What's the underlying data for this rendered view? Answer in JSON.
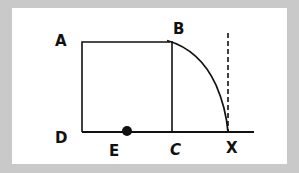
{
  "figure": {
    "colors": {
      "background": "#c9c9c9",
      "panel": "#ffffff",
      "stroke": "#111111"
    },
    "labels": {
      "A": "A",
      "B": "B",
      "C": "C",
      "D": "D",
      "E": "E",
      "X": "X"
    },
    "points": {
      "A": [
        82,
        42
      ],
      "B": [
        172,
        42
      ],
      "C": [
        172,
        132
      ],
      "D": [
        82,
        132
      ],
      "E": [
        127,
        131
      ],
      "X": [
        228,
        132
      ]
    },
    "elements": [
      {
        "type": "square",
        "vertices": [
          "A",
          "B",
          "C",
          "D"
        ]
      },
      {
        "type": "arc",
        "from": "B",
        "to": "X",
        "style": "solid"
      },
      {
        "type": "line",
        "from": "D",
        "to": "baseline-end",
        "style": "solid"
      },
      {
        "type": "line",
        "at": "X",
        "orientation": "vertical",
        "style": "dashed"
      },
      {
        "type": "point",
        "at": "E",
        "style": "filled-dot"
      }
    ]
  }
}
